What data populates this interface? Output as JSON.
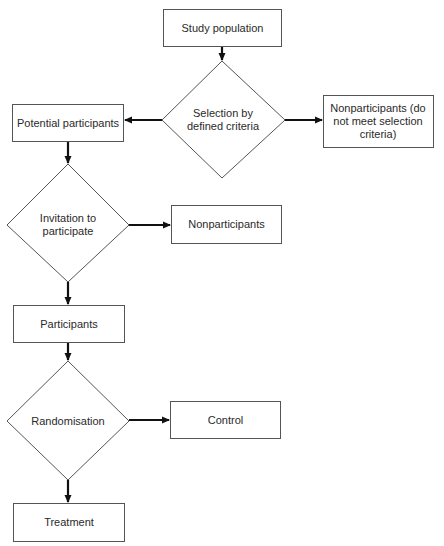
{
  "diagram": {
    "type": "flowchart",
    "colors": {
      "stroke": "#555555",
      "arrow": "#111111",
      "text": "#2a2a2a",
      "background": "#ffffff"
    },
    "nodes": {
      "study_population": {
        "shape": "rectangle",
        "label": "Study population"
      },
      "selection": {
        "shape": "diamond",
        "label": "Selection by defined criteria"
      },
      "nonparticipants_criteria": {
        "shape": "rectangle",
        "label": "Nonparticipants (do not meet selection criteria)"
      },
      "potential_participants": {
        "shape": "rectangle",
        "label": "Potential participants"
      },
      "invitation": {
        "shape": "diamond",
        "label": "Invitation to participate"
      },
      "nonparticipants": {
        "shape": "rectangle",
        "label": "Nonparticipants"
      },
      "participants": {
        "shape": "rectangle",
        "label": "Participants"
      },
      "randomisation": {
        "shape": "diamond",
        "label": "Randomisation"
      },
      "control": {
        "shape": "rectangle",
        "label": "Control"
      },
      "treatment": {
        "shape": "rectangle",
        "label": "Treatment"
      }
    },
    "edges": [
      {
        "from": "study_population",
        "to": "selection"
      },
      {
        "from": "selection",
        "to": "nonparticipants_criteria"
      },
      {
        "from": "selection",
        "to": "potential_participants"
      },
      {
        "from": "potential_participants",
        "to": "invitation"
      },
      {
        "from": "invitation",
        "to": "nonparticipants"
      },
      {
        "from": "invitation",
        "to": "participants"
      },
      {
        "from": "participants",
        "to": "randomisation"
      },
      {
        "from": "randomisation",
        "to": "control"
      },
      {
        "from": "randomisation",
        "to": "treatment"
      }
    ]
  }
}
